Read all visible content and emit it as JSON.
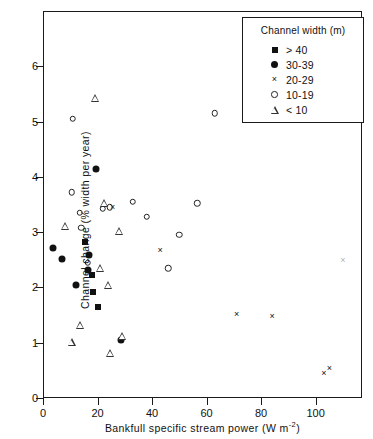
{
  "chart_data": {
    "type": "scatter",
    "title": "",
    "xlabel": "Bankfull specific stream power (W m⁻²)",
    "ylabel": "Channel change (% width per year)",
    "xlim": [
      0,
      117
    ],
    "ylim": [
      0,
      7
    ],
    "xticks": [
      0,
      20,
      40,
      60,
      80,
      100
    ],
    "yticks": [
      0,
      1,
      2,
      3,
      4,
      5,
      6
    ],
    "grid": false,
    "legend_position": "top-right",
    "legend_title": "Channel width (m)",
    "series": [
      {
        "name": "> 40",
        "marker": "square",
        "points": [
          [
            15.5,
            2.82
          ],
          [
            18.0,
            2.22
          ],
          [
            18.5,
            1.92
          ],
          [
            20.0,
            1.65
          ]
        ]
      },
      {
        "name": "30-39",
        "marker": "circle-filled",
        "points": [
          [
            3.5,
            2.72
          ],
          [
            7.0,
            2.52
          ],
          [
            19.5,
            4.15
          ],
          [
            17.0,
            2.58
          ],
          [
            16.5,
            2.32
          ],
          [
            12.0,
            2.05
          ],
          [
            28.5,
            1.05
          ]
        ]
      },
      {
        "name": "20-29",
        "marker": "cross",
        "points": [
          [
            25.5,
            3.45
          ],
          [
            43.0,
            2.68
          ],
          [
            71.0,
            1.52
          ],
          [
            84.0,
            1.48
          ],
          [
            103.0,
            0.45
          ],
          [
            105.0,
            0.55
          ],
          [
            110.0,
            2.5
          ]
        ]
      },
      {
        "name": "10-19",
        "marker": "circle-open",
        "points": [
          [
            11.0,
            5.05
          ],
          [
            10.5,
            3.72
          ],
          [
            13.5,
            3.35
          ],
          [
            14.0,
            3.08
          ],
          [
            22.0,
            3.42
          ],
          [
            24.5,
            3.45
          ],
          [
            33.0,
            3.55
          ],
          [
            38.0,
            3.28
          ],
          [
            50.0,
            2.95
          ],
          [
            46.0,
            2.35
          ],
          [
            56.5,
            3.52
          ],
          [
            63.0,
            5.15
          ],
          [
            16.5,
            2.45
          ]
        ]
      },
      {
        "name": "< 10",
        "marker": "triangle",
        "points": [
          [
            19.0,
            5.42
          ],
          [
            8.0,
            3.12
          ],
          [
            22.5,
            3.52
          ],
          [
            28.0,
            3.02
          ],
          [
            24.0,
            2.05
          ],
          [
            13.5,
            1.32
          ],
          [
            10.5,
            1.02
          ],
          [
            29.0,
            1.12
          ],
          [
            24.5,
            0.82
          ],
          [
            21.0,
            2.35
          ]
        ]
      }
    ],
    "legend_entries": [
      {
        "label": "> 40",
        "marker": "square"
      },
      {
        "label": "30-39",
        "marker": "circle-filled"
      },
      {
        "label": "20-29",
        "marker": "cross"
      },
      {
        "label": "10-19",
        "marker": "circle-open"
      },
      {
        "label": "< 10",
        "marker": "triangle"
      }
    ]
  }
}
